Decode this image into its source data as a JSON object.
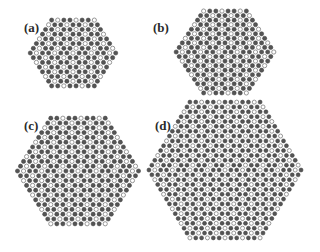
{
  "figure": {
    "background": "#ffffff",
    "atom_colors": {
      "filled": "#555555",
      "filled_stroke": "#3a3a3a",
      "open_fill": "#ffffff",
      "open_stroke": "#8a8a8a"
    },
    "panels": [
      {
        "id": "a",
        "label": "(a)",
        "label_pos": [
          24,
          21
        ],
        "center": [
          73,
          53
        ],
        "rows": 15,
        "top_row_count": 8,
        "dx": 6.1,
        "dy": 4.7,
        "atom_radius": 2.1,
        "open_ratio": 0.33
      },
      {
        "id": "b",
        "label": "(b)",
        "label_pos": [
          153,
          21
        ],
        "center": [
          225,
          52
        ],
        "rows": 19,
        "top_row_count": 8,
        "dx": 6.1,
        "dy": 4.55,
        "atom_radius": 2.1,
        "open_ratio": 0.33
      },
      {
        "id": "c",
        "label": "(c)",
        "label_pos": [
          24,
          119
        ],
        "center": [
          78,
          171
        ],
        "rows": 23,
        "top_row_count": 10,
        "dx": 6.05,
        "dy": 4.8,
        "atom_radius": 2.1,
        "open_ratio": 0.33
      },
      {
        "id": "d",
        "label": "(d)",
        "label_pos": [
          155,
          119
        ],
        "center": [
          225,
          170
        ],
        "rows": 29,
        "top_row_count": 13,
        "dx": 5.85,
        "dy": 4.85,
        "atom_radius": 2.0,
        "open_ratio": 0.33
      }
    ]
  }
}
